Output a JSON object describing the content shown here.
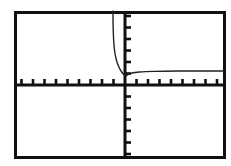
{
  "window": {
    "title": "Graphing Calculator Plot Window",
    "width": 231,
    "height": 166,
    "background_color": "#ffffff"
  },
  "frame": {
    "name": "plot-frame",
    "left": 14,
    "top": 11,
    "right": 226,
    "bottom": 159,
    "stroke_color": "#111111",
    "stroke_width": 3
  },
  "axes": {
    "x_axis": {
      "label": "x-axis",
      "y_pixel": 85,
      "stroke_color": "#111111",
      "stroke_width": 3,
      "tick_count": 18,
      "tick_spacing": 11.5,
      "tick_length": 6,
      "tick_direction": "up"
    },
    "y_axis": {
      "label": "y-axis",
      "x_pixel": 125,
      "stroke_color": "#111111",
      "stroke_width": 3,
      "tick_count": 12,
      "tick_spacing": 11.5,
      "tick_length": 6,
      "tick_direction": "right"
    },
    "origin": {
      "x": 125,
      "y": 85
    }
  },
  "chart_data": {
    "type": "line",
    "title": "",
    "xlabel": "",
    "ylabel": "",
    "grid": false,
    "legend": "none",
    "axis_style": "tick-marks-only",
    "xlim": [
      -9.6,
      8.8
    ],
    "ylim": [
      -6.4,
      6.4
    ],
    "asymptotes": {
      "vertical_x_pixel": 120,
      "horizontal_y_pixel": 71
    },
    "series": [
      {
        "name": "left-branch",
        "stroke_color": "#222222",
        "stroke_width": 1.4,
        "points": [
          [
            113,
            11
          ],
          [
            113,
            20
          ],
          [
            113.2,
            30
          ],
          [
            113.6,
            40
          ],
          [
            114.2,
            48
          ],
          [
            115.2,
            55
          ],
          [
            116.6,
            61
          ],
          [
            118.4,
            66
          ],
          [
            120.4,
            70
          ],
          [
            122.4,
            73
          ],
          [
            124.2,
            75
          ],
          [
            125.2,
            76
          ]
        ]
      },
      {
        "name": "right-branch",
        "stroke_color": "#222222",
        "stroke_width": 1.4,
        "points": [
          [
            125.2,
            76
          ],
          [
            126.4,
            75.6
          ],
          [
            128,
            74.6
          ],
          [
            130,
            73.6
          ],
          [
            133,
            72.8
          ],
          [
            137,
            72.2
          ],
          [
            142,
            71.8
          ],
          [
            149,
            71.5
          ],
          [
            158,
            71.3
          ],
          [
            170,
            71.1
          ],
          [
            185,
            71.0
          ],
          [
            200,
            71.0
          ],
          [
            213,
            71.0
          ],
          [
            224,
            71.0
          ]
        ]
      }
    ]
  },
  "marks": [
    {
      "name": "margin-speck",
      "x": 2,
      "y": 12,
      "color": "#5a5a5a"
    }
  ]
}
